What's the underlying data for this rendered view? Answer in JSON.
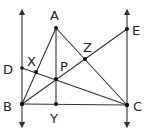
{
  "diagram": {
    "colors": {
      "line": "#333333",
      "point": "#111111",
      "text": "#222222",
      "background": "#ffffff"
    },
    "points": {
      "A": {
        "label": "A",
        "x": 56,
        "y": 28,
        "lx": 50,
        "ly": 20
      },
      "B": {
        "label": "B",
        "x": 22,
        "y": 104,
        "lx": 3,
        "ly": 111
      },
      "C": {
        "label": "C",
        "x": 127,
        "y": 105,
        "lx": 133,
        "ly": 111
      },
      "D": {
        "label": "D",
        "x": 22,
        "y": 68,
        "lx": 3,
        "ly": 74
      },
      "E": {
        "label": "E",
        "x": 127,
        "y": 29,
        "lx": 132,
        "ly": 35
      },
      "X": {
        "label": "X",
        "x": 36,
        "y": 72,
        "lx": 27,
        "ly": 66
      },
      "Y": {
        "label": "Y",
        "x": 56,
        "y": 104,
        "lx": 50,
        "ly": 123
      },
      "Z": {
        "label": "Z",
        "x": 85,
        "y": 59,
        "lx": 83,
        "ly": 52
      },
      "P": {
        "label": "P",
        "x": 56,
        "y": 79,
        "lx": 60,
        "ly": 71
      }
    },
    "segments": [
      "AB",
      "AC",
      "BC",
      "AY",
      "BE",
      "DC"
    ],
    "lines_with_arrows": [
      "BD-vertical-line",
      "CE-vertical-line"
    ]
  }
}
